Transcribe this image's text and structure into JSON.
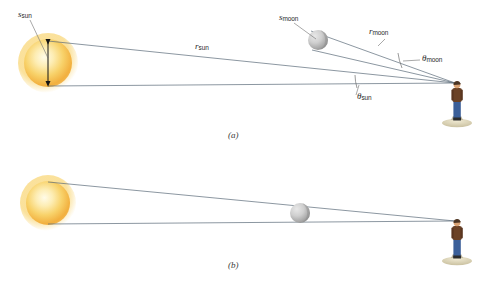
{
  "figure": {
    "panels": [
      {
        "id": "a",
        "caption": "(a)",
        "caption_pos": {
          "x": 228,
          "y": 130
        },
        "description": "Separated view showing the Sun and Moon at different angular positions with labelled diameters, distances and angular sizes."
      },
      {
        "id": "b",
        "caption": "(b)",
        "caption_pos": {
          "x": 228,
          "y": 260
        },
        "description": "Eclipse alignment view: the Moon lies on the line of sight to the Sun and exactly covers it."
      }
    ],
    "labels": [
      {
        "name": "s-sun-label",
        "base": "s",
        "sub": "sun",
        "x": 18,
        "y": 10,
        "size": 9,
        "panel": "a"
      },
      {
        "name": "r-sun-label",
        "base": "r",
        "sub": "sun",
        "x": 195,
        "y": 42,
        "size": 9,
        "panel": "a"
      },
      {
        "name": "s-moon-label",
        "base": "s",
        "sub": "moon",
        "x": 279,
        "y": 13,
        "size": 9,
        "panel": "a"
      },
      {
        "name": "r-moon-label",
        "base": "r",
        "sub": "moon",
        "x": 369,
        "y": 27,
        "size": 9,
        "panel": "a"
      },
      {
        "name": "theta-moon-label",
        "base": "θ",
        "sub": "moon",
        "x": 422,
        "y": 54,
        "size": 9,
        "panel": "a"
      },
      {
        "name": "theta-sun-label",
        "base": "θ",
        "sub": "sun",
        "x": 357,
        "y": 92,
        "size": 9,
        "panel": "a"
      }
    ],
    "bodies": [
      {
        "name": "sun-panel-a",
        "kind": "sun",
        "cx": 48,
        "cy": 63,
        "r": 24,
        "panel": "a"
      },
      {
        "name": "moon-panel-a",
        "kind": "moon",
        "cx": 318,
        "cy": 40,
        "r": 10,
        "panel": "a"
      },
      {
        "name": "observer-panel-a",
        "kind": "person",
        "x": 452,
        "y": 78,
        "panel": "a"
      },
      {
        "name": "sun-panel-b",
        "kind": "sun",
        "cx": 48,
        "cy": 203,
        "r": 22,
        "panel": "b"
      },
      {
        "name": "moon-panel-b",
        "kind": "moon",
        "cx": 300,
        "cy": 213,
        "r": 10,
        "panel": "b"
      },
      {
        "name": "observer-panel-b",
        "kind": "person",
        "x": 452,
        "y": 216,
        "panel": "b"
      }
    ],
    "colors": {
      "sun_core": "#fef4c8",
      "sun_mid": "#f7c94a",
      "sun_edge": "#f0a830",
      "moon_light": "#d9d9d9",
      "moon_dark": "#9a9a9a",
      "sight_line": "#5a6a78",
      "arrow": "#1a1a1a",
      "label_text": "#2b2b2b",
      "person_shirt": "#6b4226",
      "person_jeans": "#3b5f99",
      "ground": "#dfd9c0"
    },
    "observer_eye": {
      "panel_a": {
        "x": 455,
        "y": 83
      },
      "panel_b": {
        "x": 455,
        "y": 221
      }
    }
  }
}
